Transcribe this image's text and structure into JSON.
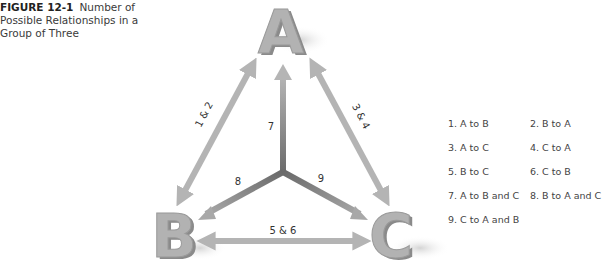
{
  "caption": {
    "figure_number": "FIGURE 12-1",
    "title": "Number of Possible Relationships in a Group of Three"
  },
  "nodes": {
    "a": "A",
    "b": "B",
    "c": "C"
  },
  "arrow_labels": {
    "ab": "1 & 2",
    "ac": "3 & 4",
    "bc": "5 & 6",
    "seven": "7",
    "eight": "8",
    "nine": "9"
  },
  "legend": {
    "items": [
      "1. A to B",
      "2. B to A",
      "3. A to C",
      "4. C to A",
      "5. B to C",
      "6. C to B",
      "7. A to B and C",
      "8. B to A and C",
      "9. C to A and B"
    ]
  },
  "colors": {
    "letter_fill": "#a9a9a9",
    "letter_shade": "#8a8a8a",
    "outer_arrow": "#b4b4b4",
    "inner_arrow_dark": "#6e6e6e",
    "inner_arrow_light": "#b0b0b0"
  }
}
